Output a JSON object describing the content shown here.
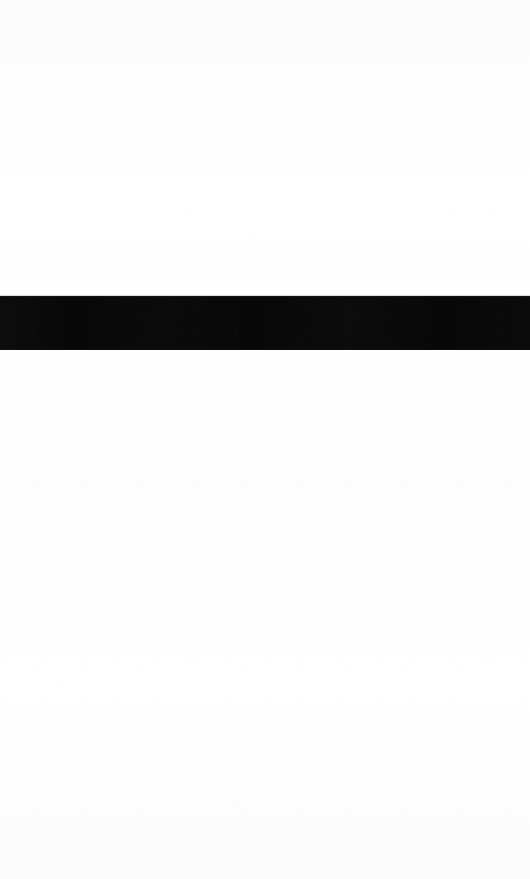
{
  "document": {
    "page_background_color": "#fdfdfd",
    "page_width": 530,
    "page_height": 879,
    "visible_text": "",
    "page_label": "",
    "header_text": "",
    "footer_text": ""
  },
  "regions": {
    "above": {
      "name": "blank-area-above-redaction",
      "text": "",
      "top": 0,
      "height": 296
    },
    "below": {
      "name": "blank-area-below-redaction",
      "text": "",
      "top": 350,
      "height": 529
    }
  },
  "redaction": {
    "label": "",
    "color": "#080808",
    "top": 296,
    "left": 0,
    "width": 530,
    "height": 54,
    "full_bleed": true,
    "covered_text": ""
  },
  "hairline": {
    "color": "#5a5a5f",
    "top": 295,
    "height": 1
  }
}
